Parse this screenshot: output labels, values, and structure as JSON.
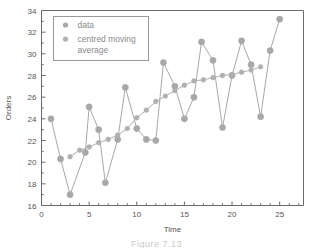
{
  "chart_data": {
    "type": "line",
    "title": "",
    "xlabel": "Time",
    "ylabel": "Orders",
    "xlim": [
      0,
      27.5
    ],
    "ylim": [
      16,
      34
    ],
    "xticks": [
      0,
      5,
      10,
      15,
      20,
      25
    ],
    "yticks": [
      16,
      18,
      20,
      22,
      24,
      26,
      28,
      30,
      32,
      34
    ],
    "grid": false,
    "legend_position": "top-left",
    "series": [
      {
        "name": "data",
        "marker": "circle",
        "color": "#a8a8a8",
        "x": [
          1,
          2,
          3,
          4.6,
          5,
          6,
          6.7,
          8,
          8.8,
          10,
          11,
          12,
          12.8,
          14,
          15,
          16,
          16.8,
          18,
          19,
          20,
          21,
          22,
          23,
          24,
          25
        ],
        "values": [
          24.0,
          20.3,
          17.0,
          20.9,
          25.1,
          23.0,
          18.1,
          22.1,
          26.9,
          23.1,
          22.1,
          22.0,
          29.2,
          27.0,
          24.0,
          26.0,
          31.1,
          29.4,
          23.2,
          28.0,
          31.2,
          29.0,
          24.2,
          30.3,
          33.2
        ]
      },
      {
        "name": "centred moving average",
        "marker": "circle",
        "color": "#b0b0b0",
        "x": [
          3,
          4,
          5,
          6,
          7,
          8,
          9,
          10,
          11,
          12,
          13,
          14,
          15,
          16,
          17,
          18,
          19,
          20,
          21,
          22,
          23
        ],
        "values": [
          20.5,
          21.1,
          21.4,
          21.8,
          22.1,
          22.5,
          23.1,
          24.1,
          24.8,
          25.6,
          26.1,
          26.6,
          27.1,
          27.5,
          27.6,
          27.8,
          28.0,
          28.1,
          28.3,
          28.5,
          28.8
        ]
      }
    ],
    "legend": [
      {
        "label": "data"
      },
      {
        "label": "centred moving",
        "label2": "average"
      }
    ],
    "colors": {
      "series": "#a8a8a8",
      "axis": "#6a6a6a",
      "text": "#555555",
      "legend_border": "#9a9a9a",
      "background": "#ffffff"
    }
  },
  "caption": {
    "text": "Figure 7.13"
  }
}
